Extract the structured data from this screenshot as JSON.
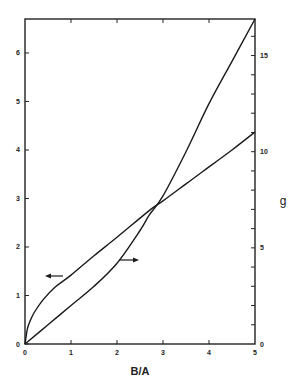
{
  "chart_data": {
    "type": "line",
    "title": "",
    "xlabel": "B/A",
    "ylabel": "",
    "ylabel_right": "g",
    "xlim": [
      0,
      5
    ],
    "ylim": [
      0,
      6.7
    ],
    "ylim_right": [
      0,
      16.9
    ],
    "grid": false,
    "legend": "none (arrows indicate axis for each curve)",
    "x_ticks": [
      "0",
      "1",
      "2",
      "3",
      "4",
      "5"
    ],
    "y_ticks_left": [
      "0",
      "1",
      "2",
      "3",
      "4",
      "5",
      "6"
    ],
    "y_ticks_right": [
      "0",
      "5",
      "10",
      "15"
    ],
    "series": [
      {
        "name": "left-axis curve",
        "axis": "left",
        "annotation": "arrow pointing left",
        "x": [
          0,
          0.05,
          0.1,
          0.2,
          0.4,
          0.65,
          1.0,
          1.5,
          2.0,
          2.7,
          3.0,
          3.5,
          4.0,
          4.5,
          5.0
        ],
        "values": [
          0,
          0.3,
          0.45,
          0.65,
          0.92,
          1.17,
          1.42,
          1.82,
          2.2,
          2.75,
          2.95,
          3.3,
          3.65,
          4.0,
          4.37
        ]
      },
      {
        "name": "g",
        "axis": "right",
        "annotation": "arrow pointing right",
        "x": [
          0,
          0.5,
          1.0,
          1.5,
          2.0,
          2.5,
          2.7,
          3.0,
          3.5,
          4.0,
          4.5,
          5.0
        ],
        "values": [
          0,
          1.0,
          2.0,
          3.0,
          4.2,
          5.9,
          6.7,
          7.7,
          10.0,
          12.5,
          14.7,
          16.9
        ]
      }
    ],
    "intersection": {
      "x": 2.7,
      "left_value": 2.75,
      "right_value": 6.7
    }
  },
  "labels": {
    "x_axis_title": "B/A",
    "right_axis_title": "g"
  }
}
